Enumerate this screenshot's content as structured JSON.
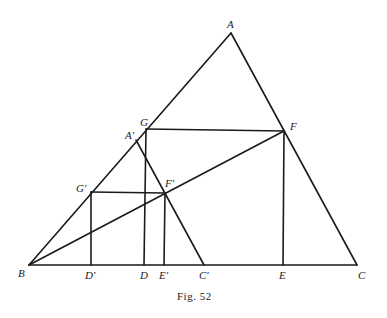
{
  "figure": {
    "caption": "Fig. 52",
    "stroke_color": "#1a1a1a",
    "background": "#ffffff"
  },
  "points": {
    "A": {
      "label": "A",
      "x": 231,
      "y": 33
    },
    "B": {
      "label": "B",
      "x": 29,
      "y": 265
    },
    "C": {
      "label": "C",
      "x": 357,
      "y": 265
    },
    "G": {
      "label": "G",
      "x": 146,
      "y": 129
    },
    "F": {
      "label": "F",
      "x": 284,
      "y": 131
    },
    "D": {
      "label": "D",
      "x": 144,
      "y": 265
    },
    "E": {
      "label": "E",
      "x": 283,
      "y": 265
    },
    "A1": {
      "label": "A′",
      "x": 136,
      "y": 140
    },
    "C1": {
      "label": "C′",
      "x": 204,
      "y": 265
    },
    "G1": {
      "label": "G′",
      "x": 91,
      "y": 192
    },
    "F1": {
      "label": "F′",
      "x": 165,
      "y": 193
    },
    "D1": {
      "label": "D′",
      "x": 91,
      "y": 265
    },
    "E1": {
      "label": "E′",
      "x": 164,
      "y": 265
    }
  },
  "segments": [
    {
      "name": "AB",
      "from": "A",
      "to": "B"
    },
    {
      "name": "AC",
      "from": "A",
      "to": "C"
    },
    {
      "name": "BC",
      "from": "B",
      "to": "C"
    },
    {
      "name": "GF",
      "from": "G",
      "to": "F"
    },
    {
      "name": "GD",
      "from": "G",
      "to": "D"
    },
    {
      "name": "FE",
      "from": "F",
      "to": "E"
    },
    {
      "name": "A'C'",
      "from": "A1",
      "to": "C1"
    },
    {
      "name": "G'F'",
      "from": "G1",
      "to": "F1"
    },
    {
      "name": "G'D'",
      "from": "G1",
      "to": "D1"
    },
    {
      "name": "F'E'",
      "from": "F1",
      "to": "E1"
    },
    {
      "name": "BF",
      "from": "B",
      "to": "F"
    }
  ]
}
